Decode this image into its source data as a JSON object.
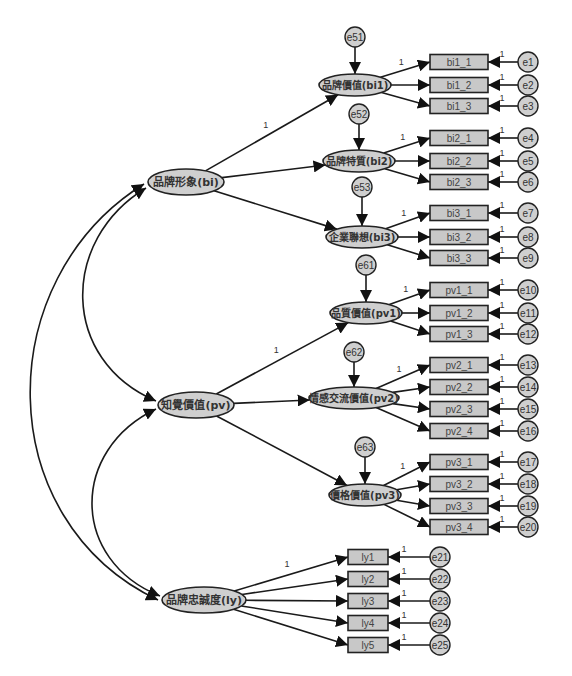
{
  "diagram": {
    "type": "structural-equation-model",
    "colors": {
      "node_fill": "#cfcfcf",
      "stroke": "#1a1a1a",
      "background": "#ffffff"
    },
    "exogenous_latents": [
      {
        "id": "bi",
        "label": "品牌形象(bi)",
        "cx": 186,
        "cy": 182
      },
      {
        "id": "pv",
        "label": "知覺價值(pv)",
        "cx": 196,
        "cy": 405
      },
      {
        "id": "ly",
        "label": "品牌忠誠度(ly)",
        "cx": 204,
        "cy": 600
      }
    ],
    "first_order_latents": [
      {
        "id": "bi1",
        "label": "品牌價值(bi1)",
        "parent": "bi",
        "cx": 355,
        "cy": 85,
        "rx": 36,
        "path_weight": "1",
        "disturbance": "e51",
        "dist_y": 37,
        "indicators": [
          {
            "label": "bi1_1",
            "y": 62,
            "error": "e1"
          },
          {
            "label": "bi1_2",
            "y": 85,
            "error": "e2"
          },
          {
            "label": "bi1_3",
            "y": 106,
            "error": "e3"
          }
        ]
      },
      {
        "id": "bi2",
        "label": "品牌特質(bi2)",
        "parent": "bi",
        "cx": 359,
        "cy": 161,
        "rx": 36,
        "path_weight": "",
        "disturbance": "e52",
        "dist_y": 114,
        "indicators": [
          {
            "label": "bi2_1",
            "y": 138,
            "error": "e4"
          },
          {
            "label": "bi2_2",
            "y": 161,
            "error": "e5"
          },
          {
            "label": "bi2_3",
            "y": 182,
            "error": "e6"
          }
        ]
      },
      {
        "id": "bi3",
        "label": "企業聯想(bi3)",
        "parent": "bi",
        "cx": 362,
        "cy": 237,
        "rx": 36,
        "path_weight": "",
        "disturbance": "e53",
        "dist_y": 187,
        "indicators": [
          {
            "label": "bi3_1",
            "y": 213,
            "error": "e7"
          },
          {
            "label": "bi3_2",
            "y": 237,
            "error": "e8"
          },
          {
            "label": "bi3_3",
            "y": 258,
            "error": "e9"
          }
        ]
      },
      {
        "id": "pv1",
        "label": "品質價值(pv1)",
        "parent": "pv",
        "cx": 366,
        "cy": 313,
        "rx": 36,
        "path_weight": "1",
        "disturbance": "e61",
        "dist_y": 265,
        "indicators": [
          {
            "label": "pv1_1",
            "y": 290,
            "error": "e10"
          },
          {
            "label": "pv1_2",
            "y": 313,
            "error": "e11"
          },
          {
            "label": "pv1_3",
            "y": 334,
            "error": "e12"
          }
        ]
      },
      {
        "id": "pv2",
        "label": "情感交流價值(pv2)",
        "parent": "pv",
        "cx": 354,
        "cy": 398,
        "rx": 45,
        "path_weight": "",
        "disturbance": "e62",
        "dist_y": 352,
        "indicators": [
          {
            "label": "pv2_1",
            "y": 365,
            "error": "e13"
          },
          {
            "label": "pv2_2",
            "y": 387,
            "error": "e14"
          },
          {
            "label": "pv2_3",
            "y": 409,
            "error": "e15"
          },
          {
            "label": "pv2_4",
            "y": 431,
            "error": "e16"
          }
        ]
      },
      {
        "id": "pv3",
        "label": "價格價值(pv3)",
        "parent": "pv",
        "cx": 365,
        "cy": 495,
        "rx": 36,
        "path_weight": "",
        "disturbance": "e63",
        "dist_y": 447,
        "indicators": [
          {
            "label": "pv3_1",
            "y": 462,
            "error": "e17"
          },
          {
            "label": "pv3_2",
            "y": 484,
            "error": "e18"
          },
          {
            "label": "pv3_3",
            "y": 506,
            "error": "e19"
          },
          {
            "label": "pv3_4",
            "y": 527,
            "error": "e20"
          }
        ]
      }
    ],
    "ly_indicators": [
      {
        "label": "ly1",
        "y": 557,
        "error": "e21"
      },
      {
        "label": "ly2",
        "y": 579,
        "error": "e22"
      },
      {
        "label": "ly3",
        "y": 601,
        "error": "e23"
      },
      {
        "label": "ly4",
        "y": 623,
        "error": "e24"
      },
      {
        "label": "ly5",
        "y": 645,
        "error": "e25"
      }
    ],
    "fixed_loading_label": "1",
    "covariances": [
      {
        "from": "bi",
        "to": "pv"
      },
      {
        "from": "pv",
        "to": "ly"
      },
      {
        "from": "bi",
        "to": "ly"
      }
    ]
  }
}
